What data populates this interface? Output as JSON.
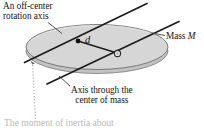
{
  "figure": {
    "labels": {
      "off_center_axis_line1": "An off-center",
      "off_center_axis_line2": "rotation axis",
      "mass_prefix": "Mass ",
      "mass_symbol": "M",
      "distance_symbol": "d",
      "com_axis_line1": "Axis through the",
      "com_axis_line2": "center of mass"
    },
    "caption": {
      "text": "The moment of inertia about"
    },
    "colors": {
      "disk_face": "#d6d6d6",
      "disk_rim": "#c2c2c2",
      "disk_outline": "#6e6e6e",
      "axis_line": "#1c1c1c",
      "leader_line": "#4a4a4a",
      "dotted_line": "#8c8c8c",
      "text": "#141414",
      "caption_text": "#b9b9b9",
      "background": "#ffffff"
    },
    "markers": {
      "off_center_point": "solid-dot",
      "center_of_mass_point": "open-circle"
    }
  }
}
